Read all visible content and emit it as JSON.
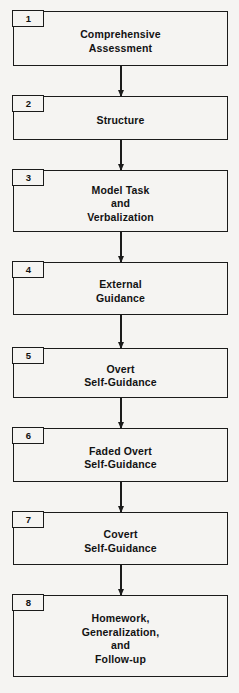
{
  "diagram": {
    "type": "vertical-flowchart",
    "background_color": "#f5f4f2",
    "line_color": "#1b1b1b",
    "text_color": "#121212",
    "steps": [
      {
        "number": "1",
        "lines": [
          "Comprehensive",
          "Assessment"
        ],
        "top": 11,
        "height": 55
      },
      {
        "number": "2",
        "lines": [
          "Structure"
        ],
        "top": 96,
        "height": 44
      },
      {
        "number": "3",
        "lines": [
          "Model Task",
          "and",
          "Verbalization"
        ],
        "top": 170,
        "height": 62
      },
      {
        "number": "4",
        "lines": [
          "External",
          "Guidance"
        ],
        "top": 262,
        "height": 53
      },
      {
        "number": "5",
        "lines": [
          "Overt",
          "Self-Guidance"
        ],
        "top": 348,
        "height": 50
      },
      {
        "number": "6",
        "lines": [
          "Faded Overt",
          "Self-Guidance"
        ],
        "top": 428,
        "height": 54
      },
      {
        "number": "7",
        "lines": [
          "Covert",
          "Self-Guidance"
        ],
        "top": 512,
        "height": 53
      },
      {
        "number": "8",
        "lines": [
          "Homework,",
          "Generalization,",
          "and",
          "Follow-up"
        ],
        "top": 595,
        "height": 82
      }
    ],
    "connectors": [
      {
        "from": "1",
        "to": "2",
        "top": 66,
        "height": 30
      },
      {
        "from": "2",
        "to": "3",
        "top": 140,
        "height": 30
      },
      {
        "from": "3",
        "to": "4",
        "top": 232,
        "height": 30
      },
      {
        "from": "4",
        "to": "5",
        "top": 315,
        "height": 33
      },
      {
        "from": "5",
        "to": "6",
        "top": 398,
        "height": 30
      },
      {
        "from": "6",
        "to": "7",
        "top": 482,
        "height": 30
      },
      {
        "from": "7",
        "to": "8",
        "top": 565,
        "height": 30
      }
    ]
  }
}
